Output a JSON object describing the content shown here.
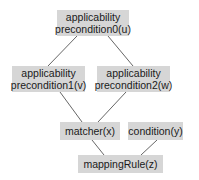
{
  "diagram": {
    "type": "dependency-graph",
    "colors": {
      "node_fill": "#d6d6d6",
      "edge": "#555555",
      "text": "#1a1a1a"
    },
    "nodes": [
      {
        "id": "u",
        "line1": "applicability",
        "line2": "precondition0(u)"
      },
      {
        "id": "v",
        "line1": "applicability",
        "line2": "precondition1(v)"
      },
      {
        "id": "w",
        "line1": "applicability",
        "line2": "precondition2(w)"
      },
      {
        "id": "x",
        "line1": "matcher(x)"
      },
      {
        "id": "y",
        "line1": "condition(y)"
      },
      {
        "id": "z",
        "line1": "mappingRule(z)"
      }
    ],
    "edges": [
      {
        "from": "u",
        "to": "v"
      },
      {
        "from": "u",
        "to": "w"
      },
      {
        "from": "v",
        "to": "x"
      },
      {
        "from": "w",
        "to": "x"
      },
      {
        "from": "x",
        "to": "z"
      },
      {
        "from": "y",
        "to": "z"
      }
    ]
  }
}
